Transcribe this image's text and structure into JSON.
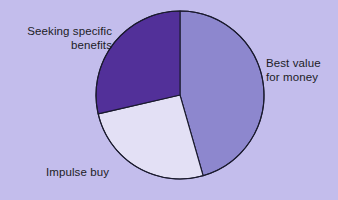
{
  "chart_data": {
    "type": "pie",
    "title": "",
    "subtitle": "",
    "xlabel": "",
    "ylabel": "",
    "legend_position": "none",
    "grid": false,
    "labels_position": "outside",
    "start_angle_deg": 0,
    "direction": "clockwise",
    "categories": [
      "Best value for money",
      "Impulse buy",
      "Seeking specific benefits"
    ],
    "values": [
      45.5,
      26.0,
      28.5
    ],
    "slices": [
      {
        "label": "Best value for money",
        "label_line_1": "Best value",
        "label_line_2": "for money",
        "value": 45.5,
        "angle_deg": 164,
        "start_angle_deg": 0,
        "end_angle_deg": 164,
        "color": "#8d87ce"
      },
      {
        "label": "Impulse buy",
        "label_line_1": "Impulse buy",
        "label_line_2": "",
        "value": 26.0,
        "angle_deg": 93,
        "start_angle_deg": 164,
        "end_angle_deg": 257,
        "color": "#e3e0f5"
      },
      {
        "label": "Seeking specific benefits",
        "label_line_1": "Seeking specific",
        "label_line_2": "benefits",
        "value": 28.5,
        "angle_deg": 103,
        "start_angle_deg": 257,
        "end_angle_deg": 360,
        "color": "#523099"
      }
    ],
    "geometry": {
      "center_x": 180,
      "center_y": 95,
      "radius": 84
    },
    "style": {
      "background": "#c3bdec",
      "outline": "#1a1a2e",
      "outline_width": 1.1,
      "label_color": "#1c1c26"
    }
  },
  "labels": {
    "seeking": "Seeking specific\nbenefits",
    "best_value": "Best value\nfor money",
    "impulse": "Impulse buy"
  }
}
